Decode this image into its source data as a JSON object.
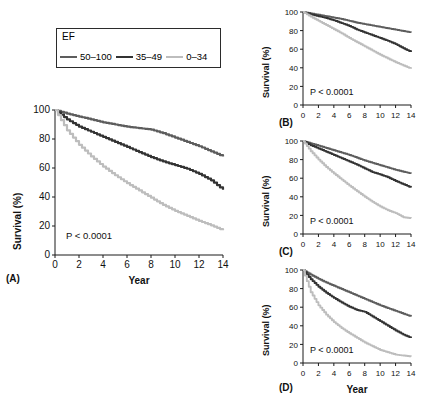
{
  "figure": {
    "legend": {
      "title": "EF",
      "items": [
        {
          "label": "50–100",
          "color": "#5d5d5d"
        },
        {
          "label": "35–49",
          "color": "#333333"
        },
        {
          "label": "0–34",
          "color": "#bdbdbd"
        }
      ]
    },
    "panels": [
      {
        "tag": "(A)",
        "pvalue": "P < 0.0001",
        "ylabel": "Survival (%)",
        "xlabel": "Year"
      },
      {
        "tag": "(B)",
        "pvalue": "P < 0.0001",
        "ylabel": "Survival (%)",
        "xlabel": ""
      },
      {
        "tag": "(C)",
        "pvalue": "P < 0.0001",
        "ylabel": "Survival (%)",
        "xlabel": ""
      },
      {
        "tag": "(D)",
        "pvalue": "P < 0.0001",
        "ylabel": "Survival (%)",
        "xlabel": "Year"
      }
    ]
  },
  "chart_data": [
    {
      "type": "line",
      "panel": "A",
      "title": "",
      "xlabel": "Year",
      "ylabel": "Survival (%)",
      "xlim": [
        0,
        14
      ],
      "ylim": [
        0,
        100
      ],
      "xticks": [
        0,
        2,
        4,
        6,
        8,
        10,
        12,
        14
      ],
      "yticks": [
        0,
        20,
        40,
        60,
        80,
        100
      ],
      "grid": false,
      "legend_position": "above-left",
      "annotations": [
        "P < 0.0001"
      ],
      "x": [
        0,
        1,
        2,
        3,
        4,
        5,
        6,
        7,
        8,
        9,
        10,
        11,
        12,
        13,
        14
      ],
      "series": [
        {
          "name": "50–100",
          "color": "#5d5d5d",
          "values": [
            100,
            97.5,
            95.5,
            93.5,
            91.5,
            90,
            88.5,
            87.5,
            86.5,
            84,
            81,
            78,
            75,
            71.5,
            68
          ]
        },
        {
          "name": "35–49",
          "color": "#333333",
          "values": [
            100,
            93.5,
            88.5,
            85,
            81.5,
            78,
            74.5,
            71,
            67.5,
            64.5,
            62,
            59.5,
            56,
            51.5,
            45
          ]
        },
        {
          "name": "0–34",
          "color": "#bdbdbd",
          "values": [
            100,
            86,
            76,
            68,
            61,
            55,
            49.5,
            44.5,
            39.5,
            34.5,
            30.5,
            27,
            23.5,
            20.5,
            17
          ]
        }
      ]
    },
    {
      "type": "line",
      "panel": "B",
      "title": "",
      "xlabel": "",
      "ylabel": "Survival (%)",
      "xlim": [
        0,
        14
      ],
      "ylim": [
        0,
        100
      ],
      "xticks": [
        0,
        2,
        4,
        6,
        8,
        10,
        12,
        14
      ],
      "yticks": [
        0,
        20,
        40,
        60,
        80,
        100
      ],
      "grid": false,
      "annotations": [
        "P < 0.0001"
      ],
      "x": [
        0,
        1,
        2,
        3,
        4,
        5,
        6,
        7,
        8,
        9,
        10,
        11,
        12,
        13,
        14
      ],
      "series": [
        {
          "name": "50–100",
          "color": "#5d5d5d",
          "values": [
            100,
            98.5,
            97,
            95.5,
            94,
            92.5,
            90.5,
            88.5,
            87,
            85.5,
            84,
            82.5,
            81,
            79.5,
            78
          ]
        },
        {
          "name": "35–49",
          "color": "#333333",
          "values": [
            100,
            97.5,
            95.5,
            93.5,
            91,
            88,
            85,
            81,
            78,
            75,
            72,
            69,
            65.5,
            61,
            57
          ]
        },
        {
          "name": "0–34",
          "color": "#bdbdbd",
          "values": [
            100,
            95,
            90.5,
            86,
            81.5,
            77,
            72,
            67.5,
            63,
            58.5,
            54,
            50,
            46,
            42.5,
            39
          ]
        }
      ]
    },
    {
      "type": "line",
      "panel": "C",
      "title": "",
      "xlabel": "",
      "ylabel": "Survival (%)",
      "xlim": [
        0,
        14
      ],
      "ylim": [
        0,
        100
      ],
      "xticks": [
        0,
        2,
        4,
        6,
        8,
        10,
        12,
        14
      ],
      "yticks": [
        0,
        20,
        40,
        60,
        80,
        100
      ],
      "grid": false,
      "annotations": [
        "P < 0.0001"
      ],
      "x": [
        0,
        1,
        2,
        3,
        4,
        5,
        6,
        7,
        8,
        9,
        10,
        11,
        12,
        13,
        14
      ],
      "series": [
        {
          "name": "50–100",
          "color": "#5d5d5d",
          "values": [
            100,
            97.5,
            95,
            92.5,
            90,
            87.5,
            85,
            82,
            79,
            76.5,
            74,
            71.5,
            69,
            67,
            65
          ]
        },
        {
          "name": "35–49",
          "color": "#333333",
          "values": [
            100,
            95.5,
            92,
            88.5,
            85,
            81.5,
            78,
            74.5,
            70.5,
            66.5,
            64,
            61,
            57,
            53.5,
            50
          ]
        },
        {
          "name": "0–34",
          "color": "#bdbdbd",
          "values": [
            100,
            89,
            80,
            72,
            65,
            58.5,
            52,
            46,
            40,
            34.5,
            29.5,
            25.5,
            22.5,
            18,
            17
          ]
        }
      ]
    },
    {
      "type": "line",
      "panel": "D",
      "title": "",
      "xlabel": "Year",
      "ylabel": "Survival (%)",
      "xlim": [
        0,
        14
      ],
      "ylim": [
        0,
        100
      ],
      "xticks": [
        0,
        2,
        4,
        6,
        8,
        10,
        12,
        14
      ],
      "yticks": [
        0,
        20,
        40,
        60,
        80,
        100
      ],
      "grid": false,
      "annotations": [
        "P < 0.0001"
      ],
      "x": [
        0,
        1,
        2,
        3,
        4,
        5,
        6,
        7,
        8,
        9,
        10,
        11,
        12,
        13,
        14
      ],
      "series": [
        {
          "name": "50–100",
          "color": "#5d5d5d",
          "values": [
            100,
            95,
            90.5,
            86.5,
            83,
            79.5,
            76,
            72.5,
            69,
            65.5,
            62,
            59,
            56,
            53,
            50
          ]
        },
        {
          "name": "35–49",
          "color": "#333333",
          "values": [
            100,
            90,
            82,
            75.5,
            70,
            65,
            60.5,
            57,
            55,
            50,
            45,
            40,
            35,
            30.5,
            27
          ]
        },
        {
          "name": "0–34",
          "color": "#bdbdbd",
          "values": [
            100,
            76,
            62,
            52,
            44,
            37.5,
            32,
            27,
            22,
            18,
            14,
            11.5,
            9,
            8,
            7
          ]
        }
      ]
    }
  ]
}
